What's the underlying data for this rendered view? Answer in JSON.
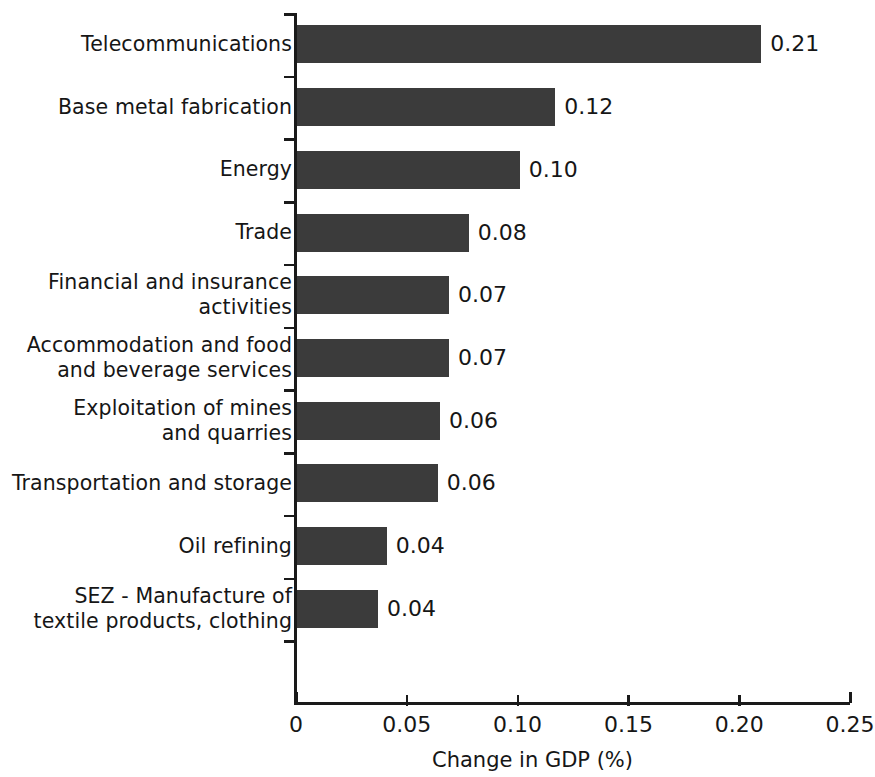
{
  "chart_data": {
    "type": "bar",
    "orientation": "horizontal",
    "title": "",
    "xlabel": "Change in GDP (%)",
    "ylabel": "",
    "xlim": [
      0,
      0.25
    ],
    "xticks": [
      "0",
      "0.05",
      "0.10",
      "0.15",
      "0.20",
      "0.25"
    ],
    "xtick_values": [
      0,
      0.05,
      0.1,
      0.15,
      0.2,
      0.25
    ],
    "grid": false,
    "legend": null,
    "bar_color": "#3b3b3b",
    "categories": [
      "Telecommunications",
      "Base metal fabrication",
      "Energy",
      "Trade",
      "Financial and insurance\nactivities",
      "Accommodation and food\nand beverage services",
      "Exploitation of mines\nand quarries",
      "Transportation and storage",
      "Oil refining",
      "SEZ - Manufacture of\ntextile products, clothing"
    ],
    "values": [
      0.21,
      0.117,
      0.101,
      0.078,
      0.069,
      0.069,
      0.065,
      0.064,
      0.041,
      0.037
    ],
    "value_labels": [
      "0.21",
      "0.12",
      "0.10",
      "0.08",
      "0.07",
      "0.07",
      "0.06",
      "0.06",
      "0.04",
      "0.04"
    ]
  }
}
